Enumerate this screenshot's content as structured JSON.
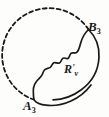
{
  "figure": {
    "type": "geometric-diagram",
    "width": 109,
    "height": 117,
    "background_color": "#fdfdfc",
    "stroke_color": "#1a1a1a",
    "labels": {
      "point_a": {
        "base": "A",
        "subscript": "3",
        "prime": ""
      },
      "point_b": {
        "base": "B",
        "subscript": "3",
        "prime": ""
      },
      "region": {
        "base": "R",
        "prime": "′",
        "subscript": "v"
      }
    },
    "elements": {
      "dashed_circle_name": "dashed-circle-arc",
      "solid_arc_name": "solid-circle-arc",
      "wavy_boundary_name": "wavy-region-boundary",
      "dash_pattern": "4 3",
      "circle_center_x": 52,
      "circle_center_y": 57,
      "circle_radius": 47
    }
  }
}
